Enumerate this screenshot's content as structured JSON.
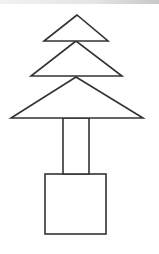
{
  "diagram": {
    "title": "",
    "stroke_color": "#333333",
    "fill_color": "#ffffff",
    "shapes": [
      {
        "name": "top-triangle",
        "type": "triangle",
        "points": [
          [
            77,
            15
          ],
          [
            44,
            41
          ],
          [
            108,
            41
          ]
        ]
      },
      {
        "name": "middle-triangle",
        "type": "triangle",
        "points": [
          [
            76,
            41
          ],
          [
            31,
            76
          ],
          [
            122,
            76
          ]
        ]
      },
      {
        "name": "bottom-triangle",
        "type": "triangle",
        "points": [
          [
            76,
            77
          ],
          [
            11,
            118
          ],
          [
            143,
            118
          ]
        ]
      },
      {
        "name": "trunk-rectangle",
        "type": "rect",
        "x": 63,
        "y": 118,
        "width": 26,
        "height": 56
      },
      {
        "name": "base-square",
        "type": "rect",
        "x": 45,
        "y": 174,
        "width": 61,
        "height": 60
      }
    ]
  }
}
